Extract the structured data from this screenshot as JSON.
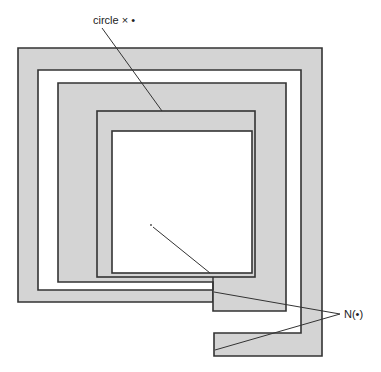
{
  "diagram": {
    "type": "square-spiral-annulus",
    "colors": {
      "fill": "#d4d4d4",
      "stroke": "#333333",
      "background": "#ffffff",
      "text": "#222222"
    },
    "labels": {
      "top": "circle × •",
      "right": "N(•)"
    },
    "annotations": [
      {
        "label": "top",
        "target": "spiral inner band top edge",
        "from": [
          102,
          28
        ],
        "to": [
          162,
          111
        ]
      },
      {
        "label": "right",
        "target": "spiral neck (upper)",
        "from": [
          340,
          314
        ],
        "to": [
          214,
          292
        ]
      },
      {
        "label": "right",
        "target": "spiral neck (lower tab)",
        "from": [
          340,
          314
        ],
        "to": [
          215,
          350
        ]
      }
    ],
    "center_point": [
      151,
      225
    ]
  }
}
